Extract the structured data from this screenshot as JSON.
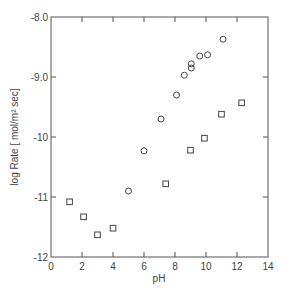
{
  "chart_data": {
    "type": "scatter",
    "title": "",
    "xlabel": "pH",
    "ylabel": "log  Rate [ mol/m² sec]",
    "xlim": [
      0,
      14
    ],
    "ylim": [
      -12,
      -8
    ],
    "xticks": [
      0,
      2,
      4,
      6,
      8,
      10,
      12,
      14
    ],
    "xtick_labels": [
      "0",
      "2",
      "4",
      "6",
      "8",
      "10",
      "12",
      "14"
    ],
    "yticks": [
      -12,
      -11,
      -10,
      -9,
      -8
    ],
    "ytick_labels": [
      "-12",
      "-11",
      "-10",
      "-9.0",
      "-8.0"
    ],
    "grid": false,
    "legend": null,
    "series": [
      {
        "name": "circles",
        "marker": "circle",
        "x": [
          5.0,
          6.0,
          7.1,
          8.1,
          8.6,
          9.05,
          9.05,
          9.6,
          10.1,
          11.1
        ],
        "y": [
          -10.9,
          -10.23,
          -9.7,
          -9.3,
          -8.97,
          -8.85,
          -8.78,
          -8.65,
          -8.63,
          -8.37
        ]
      },
      {
        "name": "squares",
        "marker": "square",
        "x": [
          1.2,
          2.1,
          3.0,
          4.0,
          7.4,
          9.0,
          9.9,
          11.0,
          12.3
        ],
        "y": [
          -11.08,
          -11.33,
          -11.63,
          -11.52,
          -10.78,
          -10.22,
          -10.02,
          -9.62,
          -9.43
        ]
      }
    ]
  },
  "colors": {
    "axis": "#555555",
    "marker": "#444444",
    "background": "#ffffff"
  }
}
